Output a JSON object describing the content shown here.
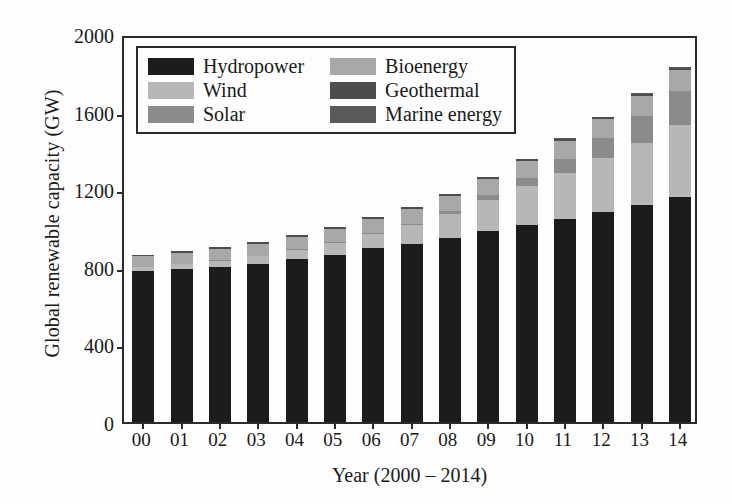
{
  "chart_data": {
    "type": "bar",
    "subtype": "stacked-bar",
    "title": "",
    "xlabel": "Year (2000 – 2014)",
    "ylabel": "Global renewable capacity (GW)",
    "categories": [
      "00",
      "01",
      "02",
      "03",
      "04",
      "05",
      "06",
      "07",
      "08",
      "09",
      "10",
      "11",
      "12",
      "13",
      "14"
    ],
    "category_years": [
      2000,
      2001,
      2002,
      2003,
      2004,
      2005,
      2006,
      2007,
      2008,
      2009,
      2010,
      2011,
      2012,
      2013,
      2014
    ],
    "ylim": [
      0,
      2000
    ],
    "yticks": [
      0,
      400,
      800,
      1200,
      1600,
      2000
    ],
    "ytick_labels": [
      "0",
      "400",
      "800",
      "1200",
      "1600",
      "2000"
    ],
    "grid": false,
    "legend_position": "upper-left-inside",
    "legend_columns": 2,
    "units": "GW",
    "series": [
      {
        "name": "Hydropower",
        "color": "#1c1c1c",
        "values": [
          780,
          790,
          800,
          815,
          840,
          862,
          895,
          920,
          950,
          985,
          1018,
          1048,
          1080,
          1120,
          1160
        ]
      },
      {
        "name": "Wind",
        "color": "#b7b7b7",
        "values": [
          18,
          24,
          31,
          40,
          48,
          59,
          74,
          94,
          121,
          159,
          198,
          238,
          283,
          319,
          370
        ]
      },
      {
        "name": "Solar",
        "color": "#8b8b8b",
        "values": [
          1,
          2,
          2,
          3,
          4,
          5,
          7,
          9,
          16,
          24,
          41,
          71,
          101,
          139,
          177
        ]
      },
      {
        "name": "Bioenergy",
        "color": "#a8a8a8",
        "values": [
          55,
          57,
          59,
          61,
          64,
          67,
          70,
          74,
          78,
          83,
          88,
          93,
          98,
          103,
          108
        ]
      },
      {
        "name": "Geothermal",
        "color": "#4d4d4d",
        "values": [
          8,
          8,
          9,
          9,
          9,
          10,
          10,
          10,
          11,
          11,
          11,
          11,
          12,
          12,
          12
        ]
      },
      {
        "name": "Marine energy",
        "color": "#5a5a5a",
        "values": [
          1,
          1,
          1,
          1,
          1,
          1,
          1,
          1,
          1,
          1,
          1,
          1,
          1,
          1,
          1
        ]
      }
    ],
    "totals": [
      863,
      882,
      902,
      929,
      966,
      1004,
      1057,
      1108,
      1177,
      1263,
      1357,
      1462,
      1575,
      1694,
      1828
    ]
  },
  "axes": {
    "y_title": "Global renewable capacity (GW)",
    "x_title": "Year (2000 – 2014)"
  },
  "legend": {
    "entries": [
      {
        "label": "Hydropower",
        "color": "#1c1c1c"
      },
      {
        "label": "Bioenergy",
        "color": "#a8a8a8"
      },
      {
        "label": "Wind",
        "color": "#b7b7b7"
      },
      {
        "label": "Geothermal",
        "color": "#4d4d4d"
      },
      {
        "label": "Solar",
        "color": "#8b8b8b"
      },
      {
        "label": "Marine energy",
        "color": "#5a5a5a"
      }
    ]
  },
  "style": {
    "axis_color": "#2b2b2b",
    "background": "#fdfdfd",
    "text_color": "#1a1a1a"
  }
}
